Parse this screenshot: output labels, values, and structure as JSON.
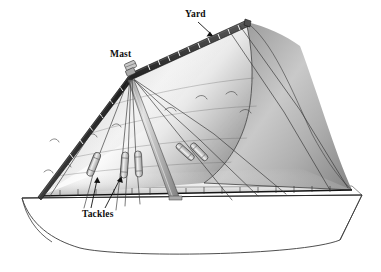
{
  "figure": {
    "name": "lateen-sail-rig-diagram",
    "background_color": "#ffffff"
  },
  "labels": [
    {
      "id": "yard",
      "text": "Yard",
      "leader": "arrow-down-right",
      "points_to": "upper spar of the sail"
    },
    {
      "id": "mast",
      "text": "Mast",
      "leader": "none",
      "points_to": "masthead where rigging converges"
    },
    {
      "id": "tackles",
      "text": "Tackles",
      "leader": "two-arrows-up",
      "points_to": "block and tackle assemblies on the halyards"
    }
  ],
  "parts": {
    "yard_label": "Yard",
    "mast_label": "Mast",
    "tackles_label": "Tackles"
  },
  "colors": {
    "outline": "#1a1a1a",
    "sail_light": "#fefefe",
    "sail_mid": "#d6d6d6",
    "sail_dark": "#8e8e8e",
    "sail_shadow": "#6f6f6f",
    "spar_dark": "#242424",
    "rope": "#3a3a3a",
    "mast_fill": "#b9b9b9",
    "hull_fill": "#ffffff",
    "label_text": "#0d0d0d"
  },
  "geometry": {
    "canvas": {
      "width": 381,
      "height": 272
    },
    "masthead": {
      "x": 131,
      "y": 74
    },
    "yard_peak": {
      "x": 246,
      "y": 22
    },
    "yard_tack": {
      "x": 40,
      "y": 196
    },
    "mast_foot": {
      "x": 175,
      "y": 200
    },
    "deck_bow": {
      "x": 22,
      "y": 198
    },
    "deck_stern": {
      "x": 362,
      "y": 195
    },
    "sail_clew": {
      "x": 352,
      "y": 190
    }
  },
  "counts": {
    "tackles_visible": 5,
    "rigging_lines": 9,
    "yard_lacing_ticks": 16
  }
}
